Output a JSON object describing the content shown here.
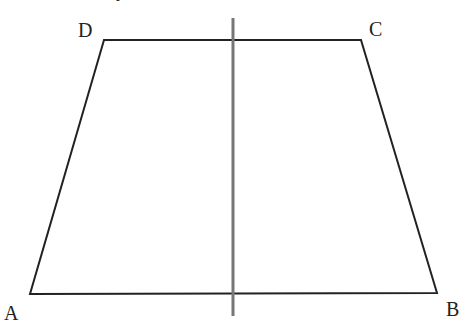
{
  "diagram": {
    "type": "trapezoid",
    "vertices": {
      "A": {
        "label": "A",
        "x": 30,
        "y": 294
      },
      "B": {
        "label": "B",
        "x": 437,
        "y": 293
      },
      "C": {
        "label": "C",
        "x": 361,
        "y": 40
      },
      "D": {
        "label": "D",
        "x": 104,
        "y": 40
      }
    },
    "axis_line": {
      "x": 233,
      "y1": 18,
      "y2": 316,
      "color": "#777777"
    },
    "edge_color": "#222222",
    "top_partial_text": "y"
  }
}
